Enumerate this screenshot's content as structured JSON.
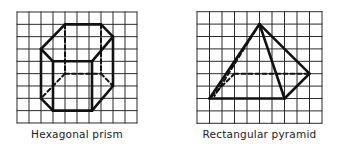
{
  "figures": [
    {
      "name": "hexagonal-prism",
      "caption": "Hexagonal prism",
      "grid": {
        "origin_x": 17,
        "origin_y": 12,
        "cell_w": 12,
        "cell_h": 12.33,
        "cols": 10,
        "rows": 9
      },
      "solid_edges": [
        [
          [
            4,
            1
          ],
          [
            7,
            1
          ]
        ],
        [
          [
            7,
            1
          ],
          [
            8,
            2
          ]
        ],
        [
          [
            8,
            2
          ],
          [
            6.25,
            4
          ]
        ],
        [
          [
            6.25,
            4
          ],
          [
            3,
            4
          ]
        ],
        [
          [
            3,
            4
          ],
          [
            2,
            3
          ]
        ],
        [
          [
            2,
            3
          ],
          [
            4,
            1
          ]
        ],
        [
          [
            2,
            3
          ],
          [
            2,
            7
          ]
        ],
        [
          [
            3,
            4
          ],
          [
            3,
            8
          ]
        ],
        [
          [
            6.25,
            4
          ],
          [
            6.25,
            8
          ]
        ],
        [
          [
            8,
            2
          ],
          [
            8,
            6
          ]
        ],
        [
          [
            2,
            7
          ],
          [
            3,
            8
          ]
        ],
        [
          [
            3,
            8
          ],
          [
            6.25,
            8
          ]
        ],
        [
          [
            6.25,
            8
          ],
          [
            8,
            6
          ]
        ]
      ],
      "dashed_edges": [
        [
          [
            4,
            1
          ],
          [
            4,
            5
          ]
        ],
        [
          [
            7,
            1
          ],
          [
            7,
            5
          ]
        ],
        [
          [
            4,
            5
          ],
          [
            7,
            5
          ]
        ],
        [
          [
            4,
            5
          ],
          [
            2,
            7
          ]
        ],
        [
          [
            7,
            5
          ],
          [
            8,
            6
          ]
        ]
      ]
    },
    {
      "name": "rectangular-pyramid",
      "caption": "Rectangular pyramid",
      "grid": {
        "origin_x": 197,
        "origin_y": 11.7,
        "cell_w": 12.5,
        "cell_h": 12.4,
        "cols": 10,
        "rows": 9
      },
      "solid_edges": [
        [
          [
            5,
            1
          ],
          [
            1,
            7
          ]
        ],
        [
          [
            5,
            1
          ],
          [
            7,
            7
          ]
        ],
        [
          [
            5,
            1
          ],
          [
            9,
            5
          ]
        ],
        [
          [
            1,
            7
          ],
          [
            7,
            7
          ]
        ],
        [
          [
            7,
            7
          ],
          [
            9,
            5
          ]
        ]
      ],
      "dashed_edges": [
        [
          [
            5,
            1
          ],
          [
            1.4,
            6.8
          ]
        ],
        [
          [
            3,
            5
          ],
          [
            9,
            5
          ]
        ],
        [
          [
            3,
            5
          ],
          [
            1,
            7
          ]
        ]
      ]
    }
  ],
  "colors": {
    "grid": "#2a2a2a",
    "edge": "#111111",
    "background": "#ffffff"
  }
}
